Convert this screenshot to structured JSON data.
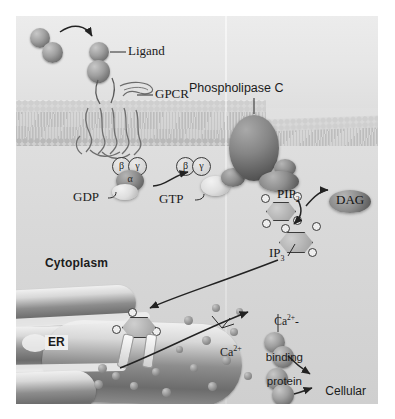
{
  "figure": {
    "regions": {
      "extracellular": "",
      "cytoplasm_label": "Cytoplasm",
      "er_label": "ER"
    },
    "labels": {
      "ligand": "Ligand",
      "gpcr": "GPCR",
      "phospholipase_c": "Phospholipase C",
      "gdp": "GDP",
      "gtp": "GTP",
      "pip2": "PIP",
      "pip2_sub": "2",
      "dag": "DAG",
      "ip3": "IP",
      "ip3_sub": "3",
      "calcium": "Ca",
      "calcium_sup": "2+",
      "ca_binding_protein_line1": "Ca",
      "ca_binding_protein_sup": "2+",
      "ca_binding_protein_dash": "-",
      "ca_binding_protein_line2": "binding",
      "ca_binding_protein_line3": "protein",
      "cellular_response_line1": "Cellular",
      "cellular_response_line2": "response",
      "alpha": "α",
      "beta": "β",
      "gamma": "γ"
    },
    "colors": {
      "ink": "#1b1b1b",
      "arrow": "#2a2a2a",
      "membrane": "#d4d4d4",
      "cytoplasm": "#d6d6d6",
      "extracellular": "#e9e9e9",
      "protein_dark": "#6a6a6a",
      "protein_light": "#dcdcdc",
      "er_dark": "#6c6c6c"
    }
  }
}
